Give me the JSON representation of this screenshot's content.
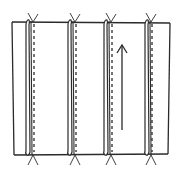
{
  "diagram": {
    "stroke_color": "#2b2b2b",
    "background": "#ffffff",
    "panel": {
      "left": 12,
      "right": 170,
      "top": 22,
      "bottom": 155
    },
    "tucks": [
      {
        "id": 1,
        "fold_x": 28,
        "stitch_x": 34
      },
      {
        "id": 2,
        "fold_x": 70,
        "stitch_x": 76
      },
      {
        "id": 3,
        "fold_x": 106,
        "stitch_x": 112
      },
      {
        "id": 4,
        "fold_x": 147,
        "stitch_x": 152
      }
    ],
    "grain_arrow": {
      "x": 122,
      "y_top": 45,
      "y_bottom": 130,
      "direction": "up"
    }
  }
}
